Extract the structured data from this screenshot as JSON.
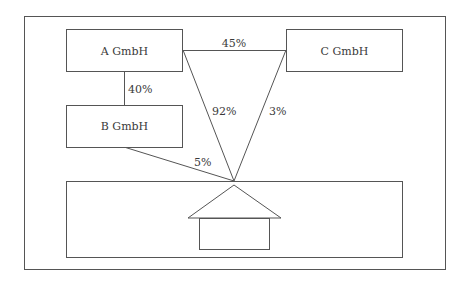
{
  "diagram": {
    "entities": [
      {
        "id": "a",
        "label": "A GmbH"
      },
      {
        "id": "b",
        "label": "B GmbH"
      },
      {
        "id": "c",
        "label": "C GmbH"
      }
    ],
    "edges": [
      {
        "from": "a",
        "to": "b",
        "label": "40%"
      },
      {
        "from": "a",
        "to": "c",
        "label": "45%"
      },
      {
        "from": "a",
        "to": "property",
        "label": "92%"
      },
      {
        "from": "c",
        "to": "property",
        "label": "3%"
      },
      {
        "from": "b",
        "to": "property",
        "label": "5%"
      }
    ],
    "property": {
      "icon": "house-icon"
    }
  }
}
